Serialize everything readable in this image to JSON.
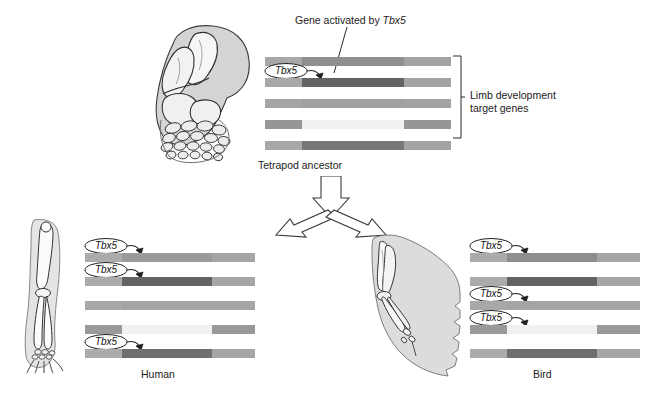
{
  "figure": {
    "title_annotation": "Gene activated by Tbx5",
    "title_annotation_plain": "Gene activated by ",
    "title_annotation_italic": "Tbx5",
    "bracket_label_line1": "Limb development",
    "bracket_label_line2": "target genes",
    "ancestor_label": "Tetrapod ancestor",
    "human_label": "Human",
    "bird_label": "Bird",
    "gene_tag_text": "Tbx5"
  },
  "colors": {
    "bar_light": "#b0b0b0",
    "bar_mid": "#9a9a9a",
    "bar_dark": "#666666",
    "bar_pale": "#ededed",
    "bar_palest": "#f4f4f4",
    "outline": "#2a2a2a",
    "text": "#1b1b1b",
    "art_fill": "#d6d6d6",
    "art_fill_light": "#e8e8e8",
    "art_line": "#3a3a3a"
  },
  "groups": {
    "ancestor": {
      "name": "tetrapod-ancestor-gene-panel",
      "bars": [
        {
          "id": "ancestor-bar-1",
          "tagged": false,
          "segments": [
            {
              "color": "#a8a8a8",
              "width": 20
            },
            {
              "color": "#8f8f8f",
              "width": 55
            },
            {
              "color": "#a3a3a3",
              "width": 25
            }
          ]
        },
        {
          "id": "ancestor-bar-2",
          "tagged": true,
          "tag": "Tbx5",
          "segments": [
            {
              "color": "#a8a8a8",
              "width": 20
            },
            {
              "color": "#636363",
              "width": 55
            },
            {
              "color": "#a3a3a3",
              "width": 25
            }
          ]
        },
        {
          "id": "ancestor-bar-3",
          "tagged": false,
          "segments": [
            {
              "color": "#a5a5a5",
              "width": 20
            },
            {
              "color": "#a0a0a0",
              "width": 55
            },
            {
              "color": "#a3a3a3",
              "width": 25
            }
          ]
        },
        {
          "id": "ancestor-bar-4",
          "tagged": false,
          "segments": [
            {
              "color": "#969696",
              "width": 20
            },
            {
              "color": "#f0f0f0",
              "width": 55
            },
            {
              "color": "#969696",
              "width": 25
            }
          ]
        },
        {
          "id": "ancestor-bar-5",
          "tagged": false,
          "segments": [
            {
              "color": "#a8a8a8",
              "width": 20
            },
            {
              "color": "#777777",
              "width": 55
            },
            {
              "color": "#a3a3a3",
              "width": 25
            }
          ]
        }
      ]
    },
    "human": {
      "name": "human-gene-panel",
      "label": "Human",
      "bars": [
        {
          "id": "human-bar-1",
          "tagged": true,
          "tag": "Tbx5",
          "segments": [
            {
              "color": "#ababab",
              "width": 22
            },
            {
              "color": "#9b9b9b",
              "width": 53
            },
            {
              "color": "#a6a6a6",
              "width": 25
            }
          ]
        },
        {
          "id": "human-bar-2",
          "tagged": true,
          "tag": "Tbx5",
          "segments": [
            {
              "color": "#ababab",
              "width": 22
            },
            {
              "color": "#636363",
              "width": 53
            },
            {
              "color": "#a6a6a6",
              "width": 25
            }
          ]
        },
        {
          "id": "human-bar-3",
          "tagged": false,
          "segments": [
            {
              "color": "#a8a8a8",
              "width": 22
            },
            {
              "color": "#a4a4a4",
              "width": 53
            },
            {
              "color": "#a6a6a6",
              "width": 25
            }
          ]
        },
        {
          "id": "human-bar-4",
          "tagged": false,
          "segments": [
            {
              "color": "#9a9a9a",
              "width": 22
            },
            {
              "color": "#f1f1f1",
              "width": 53
            },
            {
              "color": "#999999",
              "width": 25
            }
          ]
        },
        {
          "id": "human-bar-5",
          "tagged": true,
          "tag": "Tbx5",
          "segments": [
            {
              "color": "#ababab",
              "width": 22
            },
            {
              "color": "#6f6f6f",
              "width": 53
            },
            {
              "color": "#a6a6a6",
              "width": 25
            }
          ]
        }
      ]
    },
    "bird": {
      "name": "bird-gene-panel",
      "label": "Bird",
      "bars": [
        {
          "id": "bird-bar-1",
          "tagged": true,
          "tag": "Tbx5",
          "segments": [
            {
              "color": "#ababab",
              "width": 22
            },
            {
              "color": "#8e8e8e",
              "width": 53
            },
            {
              "color": "#a6a6a6",
              "width": 25
            }
          ]
        },
        {
          "id": "bird-bar-2",
          "tagged": false,
          "segments": [
            {
              "color": "#ababab",
              "width": 22
            },
            {
              "color": "#636363",
              "width": 53
            },
            {
              "color": "#a6a6a6",
              "width": 25
            }
          ]
        },
        {
          "id": "bird-bar-3",
          "tagged": true,
          "tag": "Tbx5",
          "segments": [
            {
              "color": "#a8a8a8",
              "width": 22
            },
            {
              "color": "#a4a4a4",
              "width": 53
            },
            {
              "color": "#a6a6a6",
              "width": 25
            }
          ]
        },
        {
          "id": "bird-bar-4",
          "tagged": true,
          "tag": "Tbx5",
          "segments": [
            {
              "color": "#9a9a9a",
              "width": 22
            },
            {
              "color": "#f1f1f1",
              "width": 53
            },
            {
              "color": "#999999",
              "width": 25
            }
          ]
        },
        {
          "id": "bird-bar-5",
          "tagged": false,
          "segments": [
            {
              "color": "#ababab",
              "width": 22
            },
            {
              "color": "#6f6f6f",
              "width": 53
            },
            {
              "color": "#a6a6a6",
              "width": 25
            }
          ]
        }
      ]
    }
  },
  "illustrations": {
    "ancestor_limb": "tetrapod-ancestor-limb-skeleton",
    "human_arm": "human-arm-skeleton",
    "bird_wing": "bird-wing-skeleton"
  }
}
